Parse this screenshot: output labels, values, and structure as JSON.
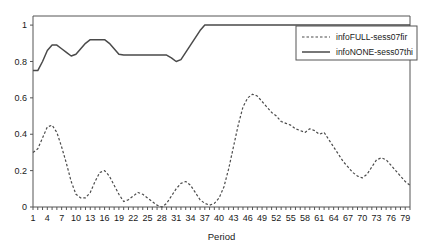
{
  "chart_data": {
    "type": "line",
    "title": "",
    "xlabel": "Period",
    "ylabel": "",
    "xlim": [
      1,
      80
    ],
    "ylim": [
      0,
      1.05
    ],
    "grid": false,
    "legend_position": "top-right",
    "y_ticks": [
      "0",
      "0.2",
      "0.4",
      "0.6",
      "0.8",
      "1"
    ],
    "y_tick_values": [
      0,
      0.2,
      0.4,
      0.6,
      0.8,
      1
    ],
    "x_ticks": [
      "1",
      "4",
      "7",
      "10",
      "13",
      "16",
      "19",
      "22",
      "25",
      "28",
      "31",
      "34",
      "37",
      "40",
      "43",
      "46",
      "49",
      "52",
      "55",
      "58",
      "61",
      "64",
      "67",
      "70",
      "73",
      "76",
      "79"
    ],
    "x_tick_values": [
      1,
      4,
      7,
      10,
      13,
      16,
      19,
      22,
      25,
      28,
      31,
      34,
      37,
      40,
      43,
      46,
      49,
      52,
      55,
      58,
      61,
      64,
      67,
      70,
      73,
      76,
      79
    ],
    "x": [
      1,
      2,
      3,
      4,
      5,
      6,
      7,
      8,
      9,
      10,
      11,
      12,
      13,
      14,
      15,
      16,
      17,
      18,
      19,
      20,
      21,
      22,
      23,
      24,
      25,
      26,
      27,
      28,
      29,
      30,
      31,
      32,
      33,
      34,
      35,
      36,
      37,
      38,
      39,
      40,
      41,
      42,
      43,
      44,
      45,
      46,
      47,
      48,
      49,
      50,
      51,
      52,
      53,
      54,
      55,
      56,
      57,
      58,
      59,
      60,
      61,
      62,
      63,
      64,
      65,
      66,
      67,
      68,
      69,
      70,
      71,
      72,
      73,
      74,
      75,
      76,
      77,
      78,
      79,
      80
    ],
    "series": [
      {
        "name": "infoFULL-sess07fir",
        "style": "dashed",
        "color": "#4a4a4a",
        "values": [
          0.3,
          0.32,
          0.38,
          0.44,
          0.45,
          0.41,
          0.33,
          0.24,
          0.14,
          0.07,
          0.05,
          0.05,
          0.08,
          0.14,
          0.19,
          0.2,
          0.17,
          0.12,
          0.07,
          0.03,
          0.04,
          0.06,
          0.08,
          0.07,
          0.05,
          0.03,
          0.01,
          0.0,
          0.02,
          0.06,
          0.1,
          0.13,
          0.14,
          0.12,
          0.08,
          0.04,
          0.02,
          0.01,
          0.02,
          0.05,
          0.11,
          0.21,
          0.33,
          0.45,
          0.55,
          0.6,
          0.62,
          0.61,
          0.58,
          0.55,
          0.52,
          0.5,
          0.47,
          0.46,
          0.45,
          0.43,
          0.42,
          0.41,
          0.43,
          0.42,
          0.4,
          0.41,
          0.37,
          0.33,
          0.29,
          0.25,
          0.22,
          0.19,
          0.17,
          0.16,
          0.18,
          0.22,
          0.26,
          0.27,
          0.26,
          0.23,
          0.2,
          0.17,
          0.14,
          0.12
        ]
      },
      {
        "name": "infoNONE-sess07thi",
        "style": "solid",
        "color": "#4a4a4a",
        "values": [
          0.75,
          0.75,
          0.8,
          0.86,
          0.89,
          0.89,
          0.87,
          0.85,
          0.83,
          0.84,
          0.87,
          0.9,
          0.92,
          0.92,
          0.92,
          0.92,
          0.9,
          0.87,
          0.84,
          0.835,
          0.835,
          0.835,
          0.835,
          0.835,
          0.835,
          0.835,
          0.835,
          0.835,
          0.835,
          0.82,
          0.8,
          0.81,
          0.85,
          0.89,
          0.93,
          0.97,
          1.0,
          1.0,
          1.0,
          1.0,
          1.0,
          1.0,
          1.0,
          1.0,
          1.0,
          1.0,
          1.0,
          1.0,
          1.0,
          1.0,
          1.0,
          1.0,
          1.0,
          1.0,
          1.0,
          1.0,
          1.0,
          1.0,
          1.0,
          1.0,
          1.0,
          1.0,
          1.0,
          1.0,
          1.0,
          1.0,
          1.0,
          1.0,
          1.0,
          1.0,
          1.0,
          1.0,
          1.0,
          1.0,
          1.0,
          1.0,
          1.0,
          1.0,
          1.0,
          1.0
        ]
      }
    ],
    "legend_entries": [
      {
        "label": "infoFULL-sess07fir",
        "style": "dashed"
      },
      {
        "label": "infoNONE-sess07thi",
        "style": "solid"
      }
    ]
  }
}
